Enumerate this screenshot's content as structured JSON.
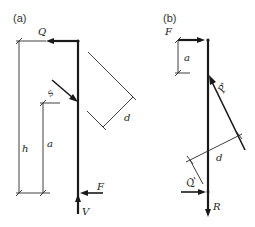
{
  "figure": {
    "panels": [
      {
        "id": "a",
        "label": "(a)",
        "symbols": {
          "Q": "Q",
          "S": "s",
          "h": "h",
          "a": "a",
          "d": "d",
          "F": "F",
          "V": "V"
        }
      },
      {
        "id": "b",
        "label": "(b)",
        "symbols": {
          "F": "F",
          "a": "a",
          "P": "P'",
          "d": "d",
          "Q": "Q'",
          "R": "R"
        }
      }
    ],
    "colors": {
      "line": "#1a1a1a",
      "background": "#ffffff"
    }
  }
}
